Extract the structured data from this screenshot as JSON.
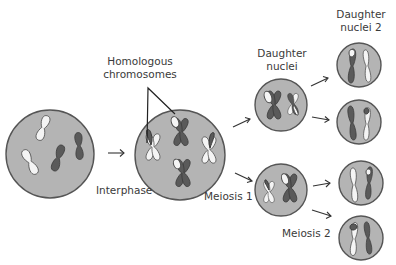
{
  "diagram": {
    "title": "Meiosis",
    "labels": {
      "homologous": "Homologous",
      "chromosomes": "chromosomes",
      "interphase": "Interphase",
      "meiosis1": "Meiosis 1",
      "meiosis2": "Meiosis 2",
      "daughter": "Daughter",
      "nuclei": "nuclei",
      "daughter2_line1": "Daughter",
      "daughter2_line2": "nuclei 2"
    },
    "colors": {
      "cell_fill": "#b4b4b4",
      "cell_stroke": "#555555",
      "chromosome_dark": "#5a5a5a",
      "chromosome_light": "#f4f4f4",
      "text": "#3a3a3a"
    },
    "stages": [
      {
        "name": "interphase-cell",
        "chromosomes": "2 light single + 2 dark single (unreplicated)"
      },
      {
        "name": "meiosis1-parent-cell",
        "chromosomes": "4 replicated X-shaped chromosomes (homologous pairs, some with crossover)"
      },
      {
        "name": "daughter-nucleus-top",
        "chromosomes": "1 dark X (light tip) + 1 light/dark X"
      },
      {
        "name": "daughter-nucleus-bottom",
        "chromosomes": "1 light/dark X + 1 dark X (light tip)"
      },
      {
        "name": "daughter2-nucleus-1",
        "chromosomes": "dark single w/ light tip + light single"
      },
      {
        "name": "daughter2-nucleus-2",
        "chromosomes": "dark single + light single w/ dark tip"
      },
      {
        "name": "daughter2-nucleus-3",
        "chromosomes": "light single + dark single w/ light tip"
      },
      {
        "name": "daughter2-nucleus-4",
        "chromosomes": "light single w/ dark tip + dark single"
      }
    ]
  }
}
